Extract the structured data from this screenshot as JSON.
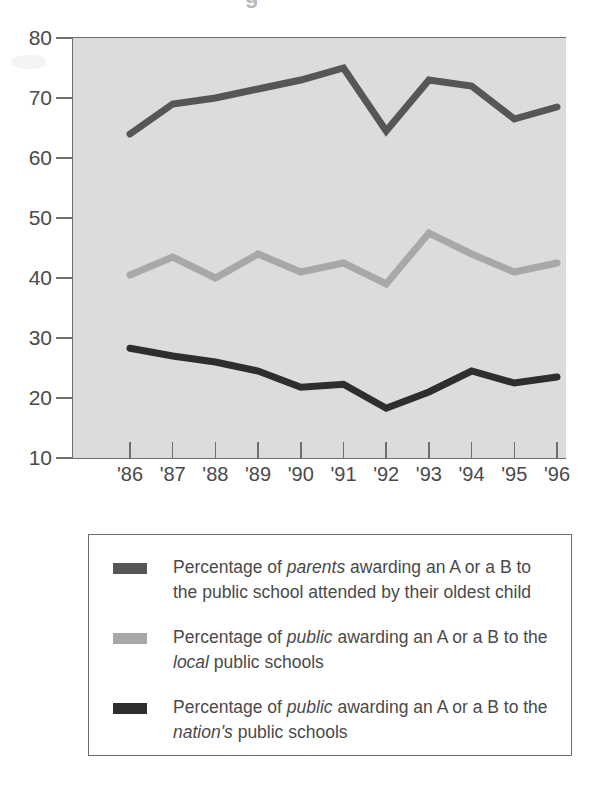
{
  "title_artifact": "g",
  "chart_data": {
    "type": "line",
    "title": "",
    "xlabel": "",
    "ylabel": "",
    "x": [
      "'86",
      "'87",
      "'88",
      "'89",
      "'90",
      "'91",
      "'92",
      "'93",
      "'94",
      "'95",
      "'96"
    ],
    "categories": [
      "'86",
      "'87",
      "'88",
      "'89",
      "'90",
      "'91",
      "'92",
      "'93",
      "'94",
      "'95",
      "'96"
    ],
    "ylim": [
      10,
      80
    ],
    "yticks": [
      10,
      20,
      30,
      40,
      50,
      60,
      70,
      80
    ],
    "ytick_labels": [
      "10",
      "20",
      "30",
      "40",
      "50",
      "60",
      "70",
      "80"
    ],
    "grid": false,
    "legend_position": "below-plot",
    "plot_background": "#dcdcdc",
    "series": [
      {
        "name": "parents-oldest-child",
        "color": "#565656",
        "values": [
          64.0,
          69.0,
          70.0,
          71.5,
          73.0,
          75.0,
          64.5,
          73.0,
          72.0,
          66.5,
          68.5
        ]
      },
      {
        "name": "public-local-schools",
        "color": "#a8a8a8",
        "values": [
          40.5,
          43.5,
          40.0,
          44.0,
          41.0,
          42.5,
          39.0,
          47.5,
          44.0,
          41.0,
          42.5
        ]
      },
      {
        "name": "public-nations-schools",
        "color": "#2e2e2e",
        "values": [
          28.3,
          27.0,
          26.0,
          24.5,
          21.8,
          22.3,
          18.3,
          21.0,
          24.5,
          22.5,
          23.5
        ]
      }
    ]
  },
  "legend": {
    "items": [
      {
        "swatch_color": "#565656",
        "text_parts": [
          {
            "t": "Percentage of ",
            "i": false
          },
          {
            "t": "parents",
            "i": true
          },
          {
            "t": " awarding an A or a B to the public school attended by their oldest child",
            "i": false
          }
        ],
        "plain": "Percentage of parents awarding an A or a B to the public school attended by their oldest child"
      },
      {
        "swatch_color": "#a8a8a8",
        "text_parts": [
          {
            "t": "Percentage of ",
            "i": false
          },
          {
            "t": "public",
            "i": true
          },
          {
            "t": " awarding an A or a B to the ",
            "i": false
          },
          {
            "t": "local",
            "i": true
          },
          {
            "t": " public schools",
            "i": false
          }
        ],
        "plain": "Percentage of public awarding an A or a B to the local public schools"
      },
      {
        "swatch_color": "#2e2e2e",
        "text_parts": [
          {
            "t": "Percentage of ",
            "i": false
          },
          {
            "t": "public",
            "i": true
          },
          {
            "t": " awarding an A or a B to the ",
            "i": false
          },
          {
            "t": "nation's",
            "i": true
          },
          {
            "t": " public schools",
            "i": false
          }
        ],
        "plain": "Percentage of public awarding an A or a B to the nation's public schools"
      }
    ]
  }
}
